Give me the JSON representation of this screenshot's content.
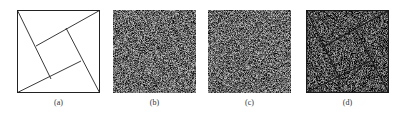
{
  "figure": {
    "panels": [
      {
        "id": "a",
        "caption": "(a)",
        "content": "line drawing: square with inscribed rotated square (pinwheel construction)",
        "background": "#ffffff",
        "noise": false,
        "lines": true
      },
      {
        "id": "b",
        "caption": "(b)",
        "content": "random noise pattern",
        "background": "#6e6e6e",
        "noise": true,
        "lines": false
      },
      {
        "id": "c",
        "caption": "(c)",
        "content": "random noise pattern",
        "background": "#6e6e6e",
        "noise": true,
        "lines": false
      },
      {
        "id": "d",
        "caption": "(d)",
        "content": "noise pattern with revealed pinwheel line drawing (overlay of b and c)",
        "background": "#5e5e5e",
        "noise": true,
        "lines": true
      }
    ],
    "line_color": "#222222"
  }
}
